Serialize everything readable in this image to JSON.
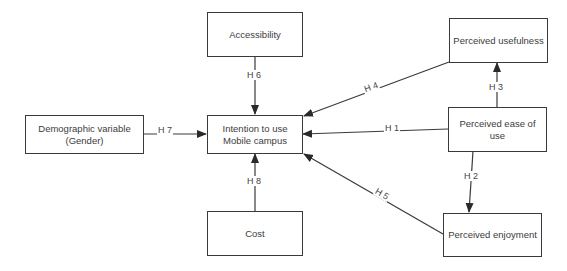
{
  "nodes": {
    "accessibility": {
      "label": "Accessibility"
    },
    "intention": {
      "line1": "Intention to use",
      "line2": "Mobile campus"
    },
    "cost": {
      "label": "Cost"
    },
    "demographic": {
      "line1": "Demographic variable",
      "line2": "(Gender)"
    },
    "usefulness": {
      "label": "Perceived usefulness"
    },
    "ease": {
      "line1": "Perceived ease of",
      "line2": "use"
    },
    "enjoyment": {
      "label": "Perceived enjoyment"
    }
  },
  "edges": {
    "h1": {
      "label": "H 1",
      "from": "Perceived ease of use",
      "to": "Intention to use Mobile campus"
    },
    "h2": {
      "label": "H 2",
      "from": "Perceived ease of use",
      "to": "Perceived enjoyment"
    },
    "h3": {
      "label": "H 3",
      "from": "Perceived ease of use",
      "to": "Perceived usefulness"
    },
    "h4": {
      "label": "H 4",
      "from": "Perceived usefulness",
      "to": "Intention to use Mobile campus"
    },
    "h5": {
      "label": "H 5",
      "from": "Perceived enjoyment",
      "to": "Intention to use Mobile campus"
    },
    "h6": {
      "label": "H 6",
      "from": "Accessibility",
      "to": "Intention to use Mobile campus"
    },
    "h7": {
      "label": "H 7",
      "from": "Demographic variable (Gender)",
      "to": "Intention to use Mobile campus"
    },
    "h8": {
      "label": "H 8",
      "from": "Cost",
      "to": "Intention to use Mobile campus"
    }
  },
  "colors": {
    "line": "#3a3a3a",
    "text": "#3c3c3c",
    "background": "#ffffff"
  }
}
